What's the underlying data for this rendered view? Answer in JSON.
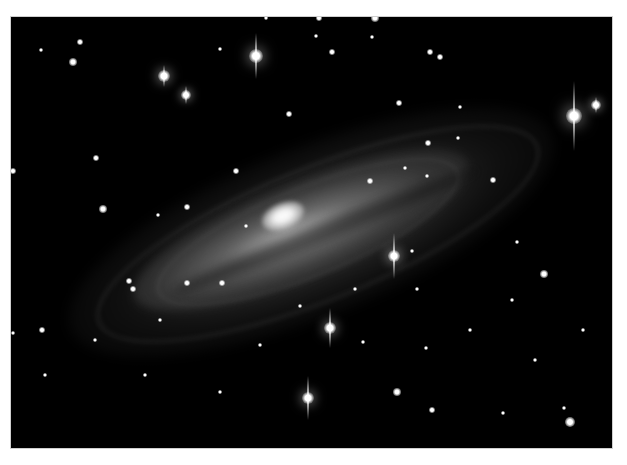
{
  "image": {
    "subject": "spiral galaxy",
    "background_color": "#000000",
    "border_color": "#ffffff",
    "frame": {
      "x": 11,
      "y": 17,
      "width": 601,
      "height": 431
    }
  },
  "galaxy": {
    "core_center": [
      272,
      201
    ],
    "tilt_deg": -22
  },
  "spiked_stars": [
    {
      "x": 256,
      "y": 56,
      "r": 7,
      "spike": 46
    },
    {
      "x": 164,
      "y": 76,
      "r": 6,
      "spike": 22
    },
    {
      "x": 186,
      "y": 95,
      "r": 5,
      "spike": 18
    },
    {
      "x": 574,
      "y": 116,
      "r": 8,
      "spike": 70
    },
    {
      "x": 596,
      "y": 105,
      "r": 5,
      "spike": 16
    },
    {
      "x": 394,
      "y": 256,
      "r": 6,
      "spike": 46
    },
    {
      "x": 330,
      "y": 328,
      "r": 6,
      "spike": 40
    },
    {
      "x": 308,
      "y": 398,
      "r": 6,
      "spike": 44
    }
  ],
  "stars": [
    {
      "x": 80,
      "y": 42,
      "r": 3
    },
    {
      "x": 41,
      "y": 50,
      "r": 2
    },
    {
      "x": 220,
      "y": 49,
      "r": 2
    },
    {
      "x": 266,
      "y": 18,
      "r": 2
    },
    {
      "x": 319,
      "y": 18,
      "r": 3
    },
    {
      "x": 375,
      "y": 18,
      "r": 4
    },
    {
      "x": 316,
      "y": 36,
      "r": 2
    },
    {
      "x": 372,
      "y": 37,
      "r": 2
    },
    {
      "x": 332,
      "y": 52,
      "r": 3
    },
    {
      "x": 430,
      "y": 52,
      "r": 3
    },
    {
      "x": 73,
      "y": 62,
      "r": 4
    },
    {
      "x": 13,
      "y": 171,
      "r": 3
    },
    {
      "x": 96,
      "y": 158,
      "r": 3
    },
    {
      "x": 103,
      "y": 209,
      "r": 4
    },
    {
      "x": 236,
      "y": 171,
      "r": 3
    },
    {
      "x": 187,
      "y": 207,
      "r": 3
    },
    {
      "x": 158,
      "y": 215,
      "r": 2
    },
    {
      "x": 246,
      "y": 226,
      "r": 2
    },
    {
      "x": 289,
      "y": 114,
      "r": 3
    },
    {
      "x": 399,
      "y": 103,
      "r": 3
    },
    {
      "x": 460,
      "y": 107,
      "r": 2
    },
    {
      "x": 440,
      "y": 57,
      "r": 3
    },
    {
      "x": 428,
      "y": 143,
      "r": 3
    },
    {
      "x": 493,
      "y": 180,
      "r": 3
    },
    {
      "x": 405,
      "y": 168,
      "r": 2
    },
    {
      "x": 427,
      "y": 176,
      "r": 2
    },
    {
      "x": 370,
      "y": 181,
      "r": 3
    },
    {
      "x": 458,
      "y": 138,
      "r": 2
    },
    {
      "x": 129,
      "y": 281,
      "r": 3
    },
    {
      "x": 133,
      "y": 289,
      "r": 3
    },
    {
      "x": 222,
      "y": 283,
      "r": 3
    },
    {
      "x": 187,
      "y": 283,
      "r": 3
    },
    {
      "x": 42,
      "y": 330,
      "r": 3
    },
    {
      "x": 13,
      "y": 333,
      "r": 2
    },
    {
      "x": 544,
      "y": 274,
      "r": 4
    },
    {
      "x": 517,
      "y": 242,
      "r": 2
    },
    {
      "x": 355,
      "y": 289,
      "r": 2
    },
    {
      "x": 417,
      "y": 289,
      "r": 2
    },
    {
      "x": 412,
      "y": 251,
      "r": 2
    },
    {
      "x": 363,
      "y": 342,
      "r": 2
    },
    {
      "x": 397,
      "y": 392,
      "r": 4
    },
    {
      "x": 426,
      "y": 348,
      "r": 2
    },
    {
      "x": 432,
      "y": 410,
      "r": 3
    },
    {
      "x": 564,
      "y": 408,
      "r": 2
    },
    {
      "x": 570,
      "y": 422,
      "r": 5
    },
    {
      "x": 503,
      "y": 413,
      "r": 2
    },
    {
      "x": 145,
      "y": 375,
      "r": 2
    },
    {
      "x": 220,
      "y": 392,
      "r": 2
    },
    {
      "x": 45,
      "y": 375,
      "r": 2
    },
    {
      "x": 583,
      "y": 330,
      "r": 2
    },
    {
      "x": 512,
      "y": 300,
      "r": 2
    },
    {
      "x": 300,
      "y": 306,
      "r": 2
    },
    {
      "x": 95,
      "y": 340,
      "r": 2
    },
    {
      "x": 470,
      "y": 330,
      "r": 2
    },
    {
      "x": 535,
      "y": 360,
      "r": 2
    },
    {
      "x": 160,
      "y": 320,
      "r": 2
    },
    {
      "x": 260,
      "y": 345,
      "r": 2
    }
  ]
}
